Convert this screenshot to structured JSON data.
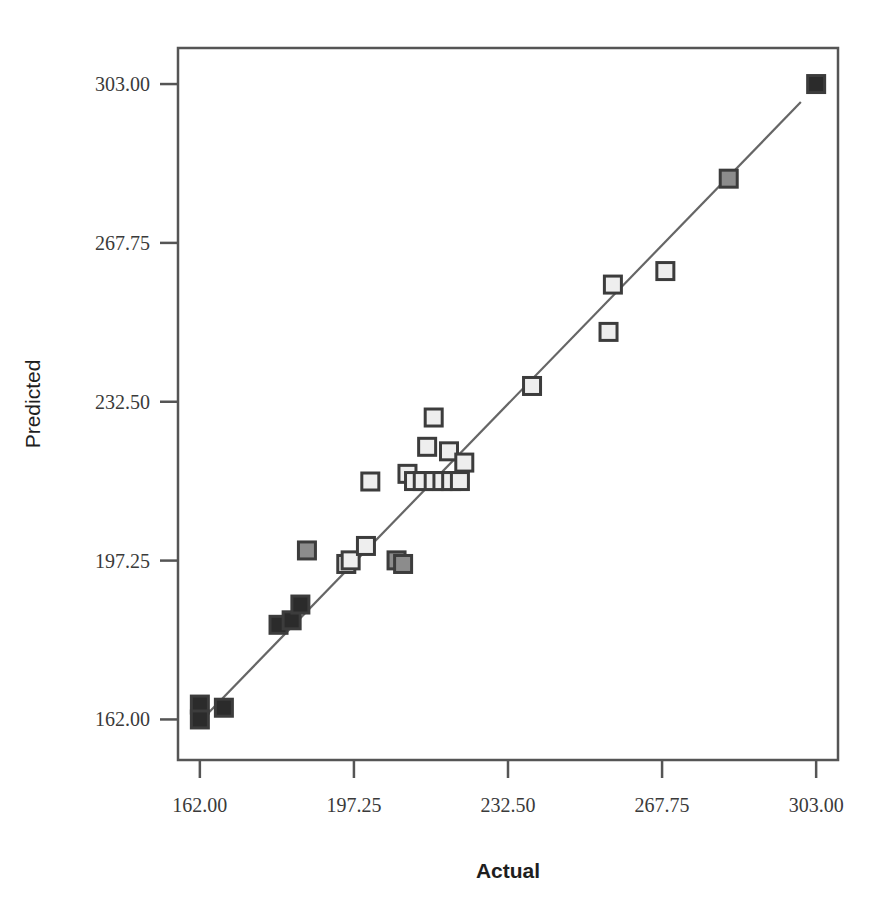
{
  "chart_data": {
    "type": "scatter",
    "title": "",
    "subtitle": "",
    "xlabel": "Actual",
    "ylabel": "Predicted",
    "xlim": [
      157.0,
      308.0
    ],
    "ylim": [
      153.0,
      311.0
    ],
    "grid": false,
    "legend": null,
    "x_ticks": [
      162.0,
      197.25,
      232.5,
      267.75,
      303.0
    ],
    "y_ticks": [
      162.0,
      197.25,
      232.5,
      267.75,
      303.0
    ],
    "x_tick_labels": [
      "162.00",
      "197.25",
      "232.50",
      "267.75",
      "303.00"
    ],
    "y_tick_labels": [
      "162.00",
      "197.25",
      "232.50",
      "267.75",
      "303.00"
    ],
    "marker": "square",
    "points": [
      {
        "x": 162.0,
        "y": 165.3,
        "fill": "dark"
      },
      {
        "x": 162.0,
        "y": 162.0,
        "fill": "dark"
      },
      {
        "x": 167.5,
        "y": 164.6,
        "fill": "dark"
      },
      {
        "x": 180.0,
        "y": 183.0,
        "fill": "dark"
      },
      {
        "x": 183.0,
        "y": 184.0,
        "fill": "dark"
      },
      {
        "x": 185.0,
        "y": 187.5,
        "fill": "dark"
      },
      {
        "x": 186.5,
        "y": 199.5,
        "fill": "mid"
      },
      {
        "x": 195.5,
        "y": 196.5,
        "fill": "light"
      },
      {
        "x": 196.5,
        "y": 197.3,
        "fill": "light"
      },
      {
        "x": 200.0,
        "y": 200.5,
        "fill": "light"
      },
      {
        "x": 201.0,
        "y": 214.8,
        "fill": "light"
      },
      {
        "x": 207.0,
        "y": 197.3,
        "fill": "mid"
      },
      {
        "x": 208.5,
        "y": 196.5,
        "fill": "mid"
      },
      {
        "x": 209.5,
        "y": 216.5,
        "fill": "light"
      },
      {
        "x": 211.0,
        "y": 214.9,
        "fill": "light"
      },
      {
        "x": 213.0,
        "y": 214.9,
        "fill": "light"
      },
      {
        "x": 215.5,
        "y": 214.9,
        "fill": "light"
      },
      {
        "x": 217.5,
        "y": 214.9,
        "fill": "light"
      },
      {
        "x": 219.5,
        "y": 214.9,
        "fill": "light"
      },
      {
        "x": 221.5,
        "y": 214.9,
        "fill": "light"
      },
      {
        "x": 214.0,
        "y": 222.5,
        "fill": "light"
      },
      {
        "x": 215.5,
        "y": 229.0,
        "fill": "light"
      },
      {
        "x": 219.0,
        "y": 221.5,
        "fill": "light"
      },
      {
        "x": 222.5,
        "y": 219.0,
        "fill": "light"
      },
      {
        "x": 238.0,
        "y": 236.0,
        "fill": "light"
      },
      {
        "x": 255.5,
        "y": 248.0,
        "fill": "light"
      },
      {
        "x": 256.5,
        "y": 258.5,
        "fill": "light"
      },
      {
        "x": 268.5,
        "y": 261.5,
        "fill": "light"
      },
      {
        "x": 283.0,
        "y": 282.0,
        "fill": "mid"
      },
      {
        "x": 303.0,
        "y": 303.0,
        "fill": "dark"
      }
    ],
    "fit_line": {
      "type": "linear",
      "x_start": 161.0,
      "y_start": 160.5,
      "x_end": 299.5,
      "y_end": 299.0
    }
  },
  "style": {
    "background": "#ffffff",
    "frame_color": "#555555",
    "line_color": "#666666",
    "marker_edge": "#3c3c3c",
    "marker_fill_light": "#eeeeee",
    "marker_fill_mid": "#8c8c8c",
    "marker_fill_dark": "#2b2b2b",
    "text_color": "#3a3a3a"
  }
}
